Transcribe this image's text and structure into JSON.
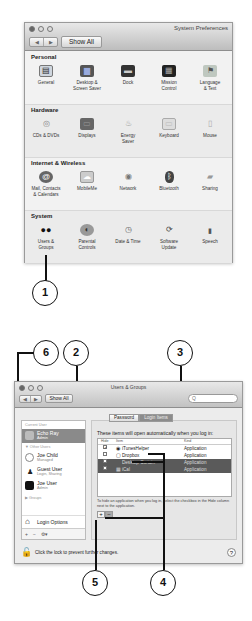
{
  "window1": {
    "title": "System Preferences",
    "nav": {
      "back": "◀",
      "forward": "▶"
    },
    "show_all": "Show All",
    "sections": [
      {
        "title": "Personal",
        "items": [
          {
            "label": "General",
            "icon": "general-icon",
            "glyph": "▤"
          },
          {
            "label": "Desktop &\nScreen Saver",
            "icon": "desktop-icon",
            "glyph": "▆"
          },
          {
            "label": "Dock",
            "icon": "dock-icon",
            "glyph": "▬"
          },
          {
            "label": "Mission\nControl",
            "icon": "mission-control-icon",
            "glyph": "▦"
          },
          {
            "label": "Language\n& Text",
            "icon": "language-icon",
            "glyph": "⚑"
          }
        ]
      },
      {
        "title": "Hardware",
        "items": [
          {
            "label": "CDs & DVDs",
            "icon": "cd-icon",
            "glyph": "◎"
          },
          {
            "label": "Displays",
            "icon": "display-icon",
            "glyph": "▭"
          },
          {
            "label": "Energy\nSaver",
            "icon": "lightbulb-icon",
            "glyph": "♨"
          },
          {
            "label": "Keyboard",
            "icon": "keyboard-icon",
            "glyph": "▭"
          },
          {
            "label": "Mouse",
            "icon": "mouse-icon",
            "glyph": "▯"
          }
        ]
      },
      {
        "title": "Internet & Wireless",
        "items": [
          {
            "label": "Mail, Contacts\n& Calendars",
            "icon": "at-icon",
            "glyph": "@"
          },
          {
            "label": "MobileMe",
            "icon": "cloud-icon",
            "glyph": "☁"
          },
          {
            "label": "Network",
            "icon": "globe-icon",
            "glyph": "◉"
          },
          {
            "label": "Bluetooth",
            "icon": "bluetooth-icon",
            "glyph": "ᛒ"
          },
          {
            "label": "Sharing",
            "icon": "folder-icon",
            "glyph": "▰"
          }
        ]
      },
      {
        "title": "System",
        "items": [
          {
            "label": "Users &\nGroups",
            "icon": "users-icon",
            "glyph": "👥"
          },
          {
            "label": "Parental\nControls",
            "icon": "parental-icon",
            "glyph": "◐"
          },
          {
            "label": "Date & Time",
            "icon": "clock-icon",
            "glyph": "◷"
          },
          {
            "label": "Software\nUpdate",
            "icon": "update-icon",
            "glyph": "⟳"
          },
          {
            "label": "Speech",
            "icon": "microphone-icon",
            "glyph": "🎙"
          }
        ]
      }
    ]
  },
  "window2": {
    "title": "Users & Groups",
    "nav": {
      "back": "◀",
      "forward": "▶"
    },
    "show_all": "Show All",
    "search": {
      "placeholder": "Q"
    },
    "sidebar": {
      "current_user_header": "Current User",
      "current_user": {
        "name": "Echo Ray",
        "role": "Admin"
      },
      "other_users_header": "▼ Other Users",
      "users": [
        {
          "name": "Joe Child",
          "role": "Managed"
        },
        {
          "name": "Guest User",
          "role": "Login, Sharing"
        },
        {
          "name": "Joe User",
          "role": "Admin"
        }
      ],
      "groups_header": "▶ Groups",
      "login_options": "Login Options",
      "tools": [
        "+",
        "−",
        "⚙▾"
      ]
    },
    "tabs": [
      {
        "label": "Password",
        "active": false
      },
      {
        "label": "Login Items",
        "active": true
      }
    ],
    "intro": "These items will open automatically when you log in:",
    "table": {
      "columns": [
        "Hide",
        "Item",
        "Kind"
      ],
      "rows": [
        {
          "hide": "✓",
          "item": "iTunesHelper",
          "kind": "Application",
          "selected": false
        },
        {
          "hide": "",
          "item": "Dropbox",
          "kind": "Application",
          "selected": false
        },
        {
          "hide": "",
          "item": "Desktop Curtain",
          "kind": "Application",
          "selected": true
        },
        {
          "hide": "",
          "item": "iCal",
          "kind": "Application",
          "selected": true
        }
      ]
    },
    "hint": "To hide an application when you log in, select the checkbox in the Hide column next to the application.",
    "add_button": "+",
    "remove_button": "−",
    "lock_text": "Click the lock to prevent further changes.",
    "help": "?"
  },
  "callouts": [
    "1",
    "2",
    "3",
    "4",
    "5",
    "6"
  ]
}
